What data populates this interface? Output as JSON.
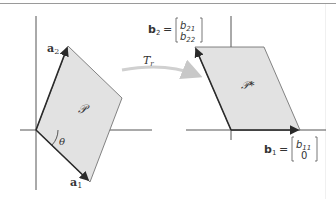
{
  "diagram": {
    "left_panel": {
      "region_label": "𝒫",
      "vector_a1": {
        "name": "a",
        "sub": "1"
      },
      "vector_a2": {
        "name": "a",
        "sub": "2"
      },
      "angle_label": "θ"
    },
    "transform": {
      "label": "T",
      "sub": "r"
    },
    "right_panel": {
      "region_label": "𝒫*",
      "vector_b1": {
        "name": "b",
        "sub": "1",
        "equals": "=",
        "matrix": [
          "b",
          "11",
          "0"
        ]
      },
      "vector_b2": {
        "name": "b",
        "sub": "2",
        "equals": "=",
        "matrix": [
          "b",
          "21",
          "b",
          "22"
        ]
      }
    },
    "colors": {
      "fill": "#e2e2e2",
      "edge": "#555555",
      "vector": "#2a2a2a",
      "axis": "#555555",
      "arrow": "#c8c8c8"
    }
  }
}
